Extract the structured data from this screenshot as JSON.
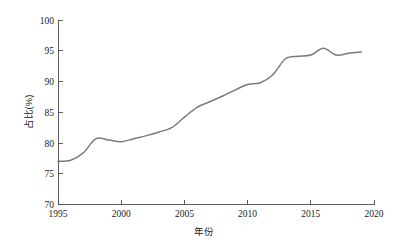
{
  "chart_data": {
    "type": "line",
    "title": "",
    "subtitle": "",
    "xlabel": "年份",
    "ylabel": "占比(%)",
    "xlim": [
      1995,
      2020
    ],
    "ylim": [
      70,
      100
    ],
    "xticks": [
      1995,
      2000,
      2005,
      2010,
      2015,
      2020
    ],
    "xticklabels": [
      "1995",
      "2000",
      "2005",
      "2010",
      "2015",
      "2020"
    ],
    "yticks": [
      70,
      75,
      80,
      85,
      90,
      95,
      100
    ],
    "yticklabels": [
      "70",
      "75",
      "80",
      "85",
      "90",
      "95",
      "100"
    ],
    "grid": false,
    "legend": null,
    "legend_position": "none",
    "line_color": "#7a7a7a",
    "line_width": 1.5,
    "markers": false,
    "annotations": [],
    "x": [
      1995,
      1996,
      1997,
      1998,
      1999,
      2000,
      2001,
      2002,
      2003,
      2004,
      2005,
      2006,
      2007,
      2008,
      2009,
      2010,
      2011,
      2012,
      2013,
      2014,
      2015,
      2016,
      2017,
      2018,
      2019
    ],
    "series": [
      {
        "name": "占比",
        "values": [
          77.0,
          77.2,
          78.4,
          80.7,
          80.5,
          80.2,
          80.7,
          81.2,
          81.8,
          82.5,
          84.2,
          85.8,
          86.7,
          87.6,
          88.6,
          89.5,
          89.8,
          91.1,
          93.7,
          94.1,
          94.3,
          95.4,
          94.3,
          94.6,
          94.8
        ]
      }
    ]
  },
  "axes": {
    "x_title": "年份",
    "y_title": "占比(%)"
  }
}
